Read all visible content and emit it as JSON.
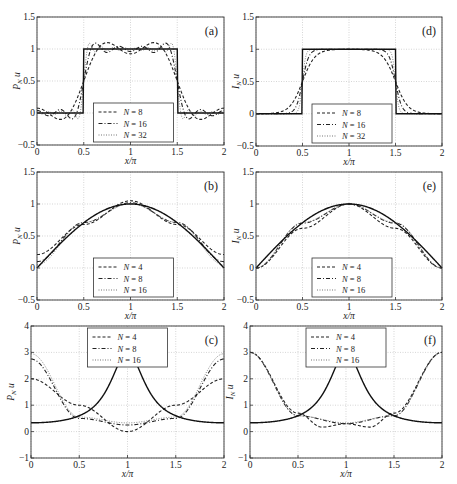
{
  "figure": {
    "x_tick_labels": [
      "0",
      "0.5",
      "1",
      "1.5",
      "2"
    ],
    "xlabel": "x/π"
  },
  "chart_data": [
    {
      "id": "a",
      "type": "line",
      "panel_label": "(a)",
      "xlabel": "x/π",
      "ylabel": "P_N u",
      "xlim": [
        0,
        2
      ],
      "ylim": [
        -0.5,
        1.5
      ],
      "yticks": [
        "-0.5",
        "0",
        "0.5",
        "1",
        "1.5"
      ],
      "grid": true,
      "legend_position": "lower center",
      "function": "square",
      "kind": "projection",
      "exact": {
        "description": "square pulse: 1 on [0.5π,1.5π], 0 elsewhere"
      },
      "series": [
        {
          "name": "N = 8",
          "style": "dashed",
          "N": 8
        },
        {
          "name": "N = 16",
          "style": "dashdot",
          "N": 16
        },
        {
          "name": "N = 32",
          "style": "dotted",
          "N": 32
        }
      ]
    },
    {
      "id": "d",
      "type": "line",
      "panel_label": "(d)",
      "xlabel": "x/π",
      "ylabel": "I_N u",
      "xlim": [
        0,
        2
      ],
      "ylim": [
        -0.5,
        1.5
      ],
      "yticks": [
        "-0.5",
        "0",
        "0.5",
        "1",
        "1.5"
      ],
      "grid": true,
      "legend_position": "lower center",
      "function": "square",
      "kind": "interpolation",
      "series": [
        {
          "name": "N = 8",
          "style": "dashed",
          "N": 8
        },
        {
          "name": "N = 16",
          "style": "dashdot",
          "N": 16
        },
        {
          "name": "N = 32",
          "style": "dotted",
          "N": 32
        }
      ]
    },
    {
      "id": "b",
      "type": "line",
      "panel_label": "(b)",
      "xlabel": "x/π",
      "ylabel": "P_N u",
      "xlim": [
        0,
        2
      ],
      "ylim": [
        -0.5,
        1.5
      ],
      "yticks": [
        "-0.5",
        "0",
        "0.5",
        "1",
        "1.5"
      ],
      "grid": true,
      "legend_position": "lower center",
      "function": "sin(x/2)",
      "kind": "projection",
      "series": [
        {
          "name": "N = 4",
          "style": "dashed",
          "N": 4,
          "x": [
            0,
            0.5,
            1,
            1.5,
            2
          ],
          "values": [
            0.21,
            0.68,
            1.05,
            0.68,
            0.21
          ]
        },
        {
          "name": "N = 8",
          "style": "dashdot",
          "N": 8,
          "x": [
            0,
            0.5,
            1,
            1.5,
            2
          ],
          "values": [
            0.1,
            0.71,
            1.02,
            0.71,
            0.1
          ]
        },
        {
          "name": "N = 16",
          "style": "dotted",
          "N": 16,
          "x": [
            0,
            0.5,
            1,
            1.5,
            2
          ],
          "values": [
            0.05,
            0.71,
            1.01,
            0.71,
            0.05
          ]
        }
      ]
    },
    {
      "id": "e",
      "type": "line",
      "panel_label": "(e)",
      "xlabel": "x/π",
      "ylabel": "I_N u",
      "xlim": [
        0,
        2
      ],
      "ylim": [
        -0.5,
        1.5
      ],
      "yticks": [
        "-0.5",
        "0",
        "0.5",
        "1",
        "1.5"
      ],
      "grid": true,
      "legend_position": "lower center",
      "function": "sin(x/2)",
      "kind": "interpolation",
      "series": [
        {
          "name": "N = 4",
          "style": "dashed",
          "N": 4,
          "x": [
            0,
            0.5,
            1,
            1.5,
            2
          ],
          "values": [
            0,
            0.62,
            1,
            0.62,
            0
          ]
        },
        {
          "name": "N = 8",
          "style": "dashdot",
          "N": 8,
          "x": [
            0,
            0.5,
            1,
            1.5,
            2
          ],
          "values": [
            0,
            0.7,
            1,
            0.7,
            0
          ]
        },
        {
          "name": "N = 16",
          "style": "dotted",
          "N": 16,
          "x": [
            0,
            0.5,
            1,
            1.5,
            2
          ],
          "values": [
            0,
            0.71,
            1,
            0.71,
            0
          ]
        }
      ]
    },
    {
      "id": "c",
      "type": "line",
      "panel_label": "(c)",
      "xlabel": "x/π",
      "ylabel": "P_N u",
      "xlim": [
        0,
        2
      ],
      "ylim": [
        -1,
        4
      ],
      "yticks": [
        "-1",
        "0",
        "1",
        "2",
        "3",
        "4"
      ],
      "grid": true,
      "legend_position": "upper center",
      "function": "smooth periodic, max 3 at ends, min ~0.33 at π",
      "kind": "projection",
      "series": [
        {
          "name": "N = 4",
          "style": "dashed",
          "N": 4,
          "x": [
            0,
            0.5,
            1,
            1.5,
            2
          ],
          "values": [
            2.0,
            1.0,
            0.0,
            1.0,
            2.0
          ]
        },
        {
          "name": "N = 8",
          "style": "dashdot",
          "N": 8,
          "x": [
            0,
            0.5,
            1,
            1.5,
            2
          ],
          "values": [
            2.75,
            0.5,
            0.25,
            0.5,
            2.75
          ]
        },
        {
          "name": "N = 16",
          "style": "dotted",
          "N": 16,
          "x": [
            0,
            0.5,
            1,
            1.5,
            2
          ],
          "values": [
            2.95,
            0.55,
            0.33,
            0.55,
            2.95
          ]
        }
      ]
    },
    {
      "id": "f",
      "type": "line",
      "panel_label": "(f)",
      "xlabel": "x/π",
      "ylabel": "I_N u",
      "xlim": [
        0,
        2
      ],
      "ylim": [
        -1,
        4
      ],
      "yticks": [
        "-1",
        "0",
        "1",
        "2",
        "3",
        "4"
      ],
      "grid": true,
      "legend_position": "upper center",
      "function": "smooth periodic, max 3 at ends, min ~0.33 at π",
      "kind": "interpolation",
      "series": [
        {
          "name": "N = 4",
          "style": "dashed",
          "N": 4,
          "x": [
            0,
            0.5,
            0.75,
            1,
            1.25,
            1.5,
            2
          ],
          "values": [
            3.0,
            0.7,
            0.17,
            0.3,
            0.17,
            0.7,
            3.0
          ]
        },
        {
          "name": "N = 8",
          "style": "dashdot",
          "N": 8,
          "x": [
            0,
            0.5,
            1,
            1.5,
            2
          ],
          "values": [
            3.0,
            0.6,
            0.3,
            0.6,
            3.0
          ]
        },
        {
          "name": "N = 16",
          "style": "dotted",
          "N": 16,
          "x": [
            0,
            0.5,
            1,
            1.5,
            2
          ],
          "values": [
            3.0,
            0.6,
            0.33,
            0.6,
            3.0
          ]
        }
      ]
    }
  ]
}
